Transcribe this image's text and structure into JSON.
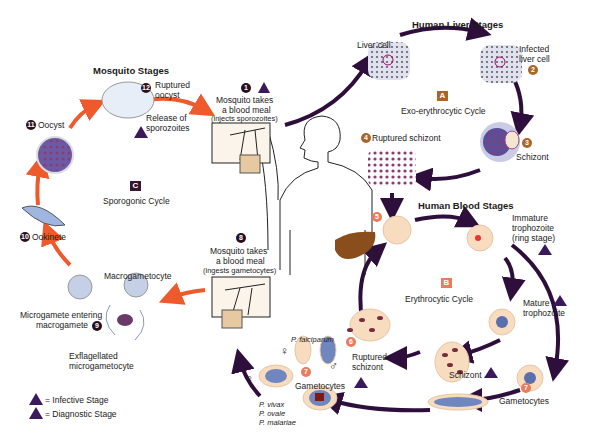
{
  "sections": {
    "mosquito_stages": "Mosquito Stages",
    "liver_stages": "Human Liver Stages",
    "blood_stages": "Human Blood Stages"
  },
  "cycles": {
    "A": {
      "letter": "A",
      "name": "Exo-erythrocytic Cycle",
      "color": "#a9652a"
    },
    "B": {
      "letter": "B",
      "name": "Erythrocytic Cycle",
      "color": "#ec7a5c"
    },
    "C": {
      "letter": "C",
      "name": "Sporogonic Cycle",
      "color": "#3a1530"
    }
  },
  "steps": {
    "s1": {
      "num": "1",
      "line1": "Mosquito takes",
      "line2": "a blood meal",
      "line3": "(injects sporozoites)"
    },
    "s2": {
      "num": "2",
      "line1": "Infected",
      "line2": "liver cell"
    },
    "liver_cell": "Liver cell",
    "s3": {
      "num": "3",
      "label": "Schizont"
    },
    "s4": {
      "num": "4",
      "label": "Ruptured schizont"
    },
    "s5": {
      "num": "5"
    },
    "ring": {
      "line1": "Immature",
      "line2": "trophozoite",
      "line3": "(ring stage)"
    },
    "mature": {
      "line1": "Mature",
      "line2": "trophozoite"
    },
    "schizont_b": "Schizont",
    "s6": {
      "num": "6",
      "line1": "Ruptured",
      "line2": "schizont"
    },
    "s7": {
      "num": "7",
      "label": "Gametocytes"
    },
    "s7b": {
      "num": "7",
      "label": "Gametocytes"
    },
    "s8": {
      "num": "8",
      "line1": "Mosquito takes",
      "line2": "a blood meal",
      "line3": "(ingests gametocytes)"
    },
    "s9": {
      "num": "9",
      "line1": "Microgamete entering",
      "line2": "macrogamete"
    },
    "macrogametocyte": "Macrogametocyte",
    "exflag": {
      "line1": "Exflagellated",
      "line2": "microgametocyte"
    },
    "s10": {
      "num": "10",
      "label": "Ookinete"
    },
    "s11": {
      "num": "11",
      "label": "Oocyst"
    },
    "s12": {
      "num": "12",
      "line1": "Ruptured",
      "line2": "oocyst"
    },
    "release": {
      "line1": "Release of",
      "line2": "sporozoites"
    }
  },
  "species": {
    "falciparum": "P. falciparum",
    "others": [
      "P. vivax",
      "P. ovale",
      "P. malariae"
    ],
    "female": "♀",
    "male": "♂"
  },
  "legend": {
    "infective": {
      "glyph": "i",
      "label": "= Infective Stage"
    },
    "diagnostic": {
      "glyph": "d",
      "label": "= Diagnostic Stage"
    }
  },
  "colors": {
    "mosquito_arrow": "#ee5a2c",
    "human_arrow": "#2e0f3c",
    "badge_dark": "#2a0f1f",
    "rbc": "#f7dcc0"
  }
}
